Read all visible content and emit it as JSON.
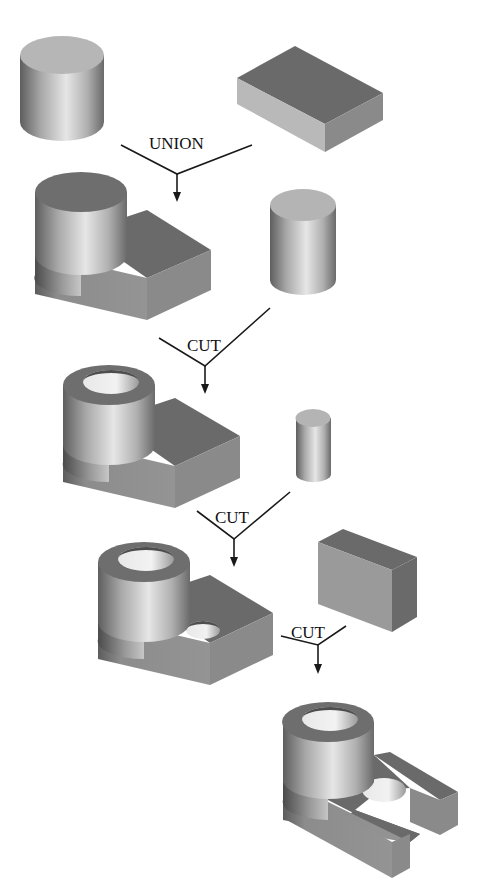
{
  "diagram": {
    "type": "csg-construction-sequence",
    "operations": [
      {
        "id": "op1",
        "label": "UNION",
        "inputs": [
          "cylinder",
          "box"
        ],
        "output": "cylinder-with-plate"
      },
      {
        "id": "op2",
        "label": "CUT",
        "inputs": [
          "cylinder-with-plate",
          "cylinder"
        ],
        "output": "bored-boss-with-plate"
      },
      {
        "id": "op3",
        "label": "CUT",
        "inputs": [
          "bored-boss-with-plate",
          "small-cylinder"
        ],
        "output": "plate-with-hole"
      },
      {
        "id": "op4",
        "label": "CUT",
        "inputs": [
          "plate-with-hole",
          "box"
        ],
        "output": "slotted-bracket"
      }
    ],
    "shapes": [
      {
        "id": "s1",
        "name": "cylinder"
      },
      {
        "id": "s2",
        "name": "box"
      },
      {
        "id": "s3",
        "name": "cylinder-with-plate"
      },
      {
        "id": "s4",
        "name": "cylinder"
      },
      {
        "id": "s5",
        "name": "bored-boss-with-plate"
      },
      {
        "id": "s6",
        "name": "small-cylinder"
      },
      {
        "id": "s7",
        "name": "plate-with-hole"
      },
      {
        "id": "s8",
        "name": "box"
      },
      {
        "id": "s9",
        "name": "slotted-bracket"
      }
    ],
    "colors": {
      "background": "#ffffff",
      "line": "#1a1a1a",
      "shade_dark": "#6a6a6a",
      "shade_mid": "#8a8a8a",
      "shade_light": "#b9b9b9"
    }
  }
}
